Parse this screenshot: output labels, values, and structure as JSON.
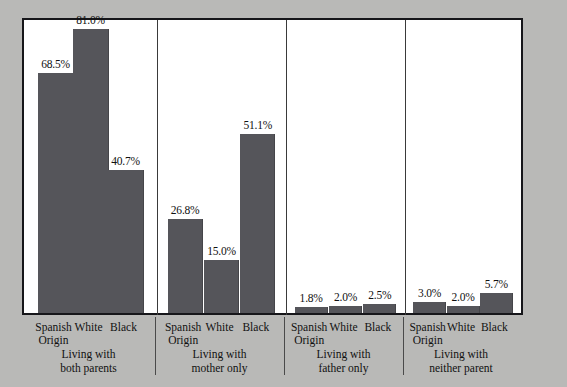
{
  "chart_data": {
    "type": "bar",
    "title": "",
    "subtitle": "",
    "xlabel": "",
    "ylabel": "",
    "ylim": [
      0,
      85
    ],
    "grid": false,
    "legend": "none",
    "value_suffix": "%",
    "categories": [
      "Spanish Origin",
      "White",
      "Black"
    ],
    "groups": [
      {
        "name": "Living with both parents",
        "line1": "Living with",
        "line2": "both parents",
        "bars": [
          {
            "category": "Spanish Origin",
            "cat_line1": "Spanish",
            "cat_line2": "Origin",
            "value": 68.5,
            "label": "68.5%"
          },
          {
            "category": "White",
            "cat_line1": "White",
            "cat_line2": "",
            "value": 81.0,
            "label": "81.0%"
          },
          {
            "category": "Black",
            "cat_line1": "Black",
            "cat_line2": "",
            "value": 40.7,
            "label": "40.7%"
          }
        ]
      },
      {
        "name": "Living with mother only",
        "line1": "Living with",
        "line2": "mother only",
        "bars": [
          {
            "category": "Spanish Origin",
            "cat_line1": "Spanish",
            "cat_line2": "Origin",
            "value": 26.8,
            "label": "26.8%"
          },
          {
            "category": "White",
            "cat_line1": "White",
            "cat_line2": "",
            "value": 15.0,
            "label": "15.0%"
          },
          {
            "category": "Black",
            "cat_line1": "Black",
            "cat_line2": "",
            "value": 51.1,
            "label": "51.1%"
          }
        ]
      },
      {
        "name": "Living with father only",
        "line1": "Living with",
        "line2": "father only",
        "bars": [
          {
            "category": "Spanish Origin",
            "cat_line1": "Spanish",
            "cat_line2": "Origin",
            "value": 1.8,
            "label": "1.8%"
          },
          {
            "category": "White",
            "cat_line1": "White",
            "cat_line2": "",
            "value": 2.0,
            "label": "2.0%"
          },
          {
            "category": "Black",
            "cat_line1": "Black",
            "cat_line2": "",
            "value": 2.5,
            "label": "2.5%"
          }
        ]
      },
      {
        "name": "Living with neither parent",
        "line1": "Living with",
        "line2": "neither parent",
        "bars": [
          {
            "category": "Spanish Origin",
            "cat_line1": "Spanish",
            "cat_line2": "Origin",
            "value": 3.0,
            "label": "3.0%"
          },
          {
            "category": "White",
            "cat_line1": "White",
            "cat_line2": "",
            "value": 2.0,
            "label": "2.0%"
          },
          {
            "category": "Black",
            "cat_line1": "Black",
            "cat_line2": "",
            "value": 5.7,
            "label": "5.7%"
          }
        ]
      }
    ],
    "colors": {
      "bar": "#55555a",
      "background": "#b9b9b7",
      "plot_background": "#ffffff",
      "frame": "#16161a",
      "separator": "#3a3a3a",
      "text": "#111111"
    }
  }
}
